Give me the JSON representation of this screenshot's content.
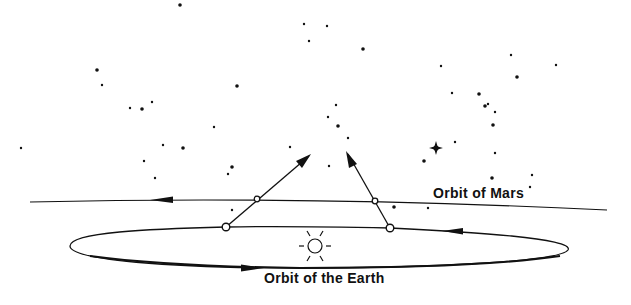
{
  "diagram": {
    "labels": {
      "mars_orbit": "Orbit of Mars",
      "earth_orbit": "Orbit of the Earth"
    },
    "colors": {
      "ink": "#111111",
      "background": "#ffffff"
    },
    "elements": {
      "sun": {
        "icon": "sun-icon",
        "cx": 315,
        "cy": 246
      },
      "earth_positions": [
        {
          "cx": 226,
          "cy": 227
        },
        {
          "cx": 390,
          "cy": 228
        }
      ],
      "mars_positions": [
        {
          "cx": 257,
          "cy": 199
        },
        {
          "cx": 375,
          "cy": 201
        }
      ],
      "sightlines": [
        {
          "from": [
            226,
            227
          ],
          "to": [
            310,
            155
          ]
        },
        {
          "from": [
            390,
            228
          ],
          "to": [
            347,
            152
          ]
        }
      ],
      "bright_star": {
        "icon": "four-point-star-icon",
        "cx": 436,
        "cy": 148
      }
    },
    "stars": [
      [
        180,
        5
      ],
      [
        304,
        24
      ],
      [
        309,
        41
      ],
      [
        97,
        70
      ],
      [
        102,
        85
      ],
      [
        130,
        108
      ],
      [
        142,
        109
      ],
      [
        152,
        102
      ],
      [
        214,
        127
      ],
      [
        237,
        86
      ],
      [
        21,
        148
      ],
      [
        163,
        145
      ],
      [
        183,
        148
      ],
      [
        144,
        161
      ],
      [
        155,
        178
      ],
      [
        232,
        167
      ],
      [
        290,
        147
      ],
      [
        327,
        26
      ],
      [
        363,
        49
      ],
      [
        441,
        66
      ],
      [
        511,
        55
      ],
      [
        517,
        77
      ],
      [
        556,
        65
      ],
      [
        452,
        93
      ],
      [
        479,
        94
      ],
      [
        488,
        104
      ],
      [
        495,
        112
      ],
      [
        485,
        106
      ],
      [
        336,
        105
      ],
      [
        328,
        117
      ],
      [
        338,
        126
      ],
      [
        348,
        138
      ],
      [
        329,
        166
      ],
      [
        493,
        125
      ],
      [
        455,
        142
      ],
      [
        495,
        153
      ],
      [
        424,
        161
      ],
      [
        532,
        175
      ],
      [
        530,
        187
      ],
      [
        492,
        178
      ],
      [
        228,
        174
      ],
      [
        428,
        208
      ],
      [
        394,
        207
      ],
      [
        232,
        210
      ]
    ]
  }
}
